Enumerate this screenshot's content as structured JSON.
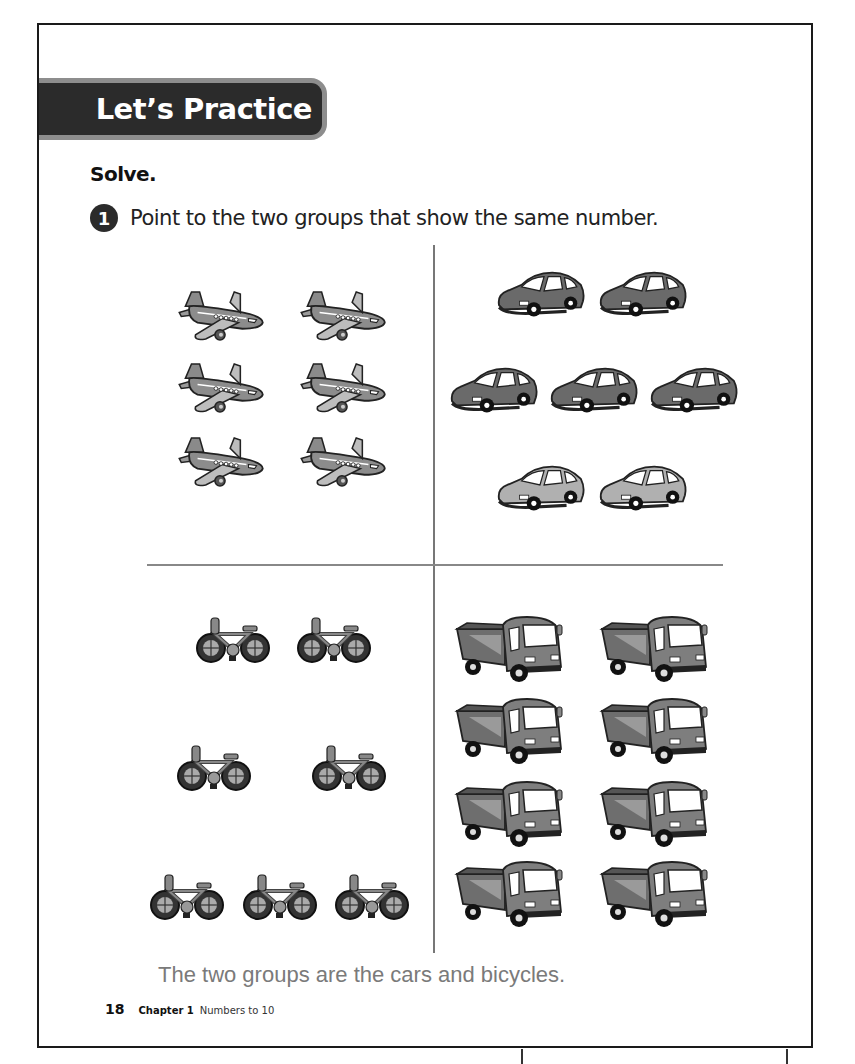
{
  "banner": {
    "title": "Let’s Practice"
  },
  "instruction": "Solve.",
  "question": {
    "number": "1",
    "text": "Point to the two groups that show the same number."
  },
  "groups": [
    {
      "name": "airplanes",
      "count": 6,
      "icon": "airplane-icon",
      "rows": [
        2,
        2,
        2
      ]
    },
    {
      "name": "cars",
      "count": 7,
      "icon": "car-icon",
      "rows": [
        2,
        3,
        2
      ]
    },
    {
      "name": "bicycles",
      "count": 7,
      "icon": "bicycle-icon",
      "rows": [
        2,
        2,
        3
      ]
    },
    {
      "name": "trucks",
      "count": 8,
      "icon": "truck-icon",
      "rows": [
        2,
        2,
        2,
        2
      ]
    }
  ],
  "answer": "The two groups are the cars and bicycles.",
  "footer": {
    "page_number": "18",
    "chapter": "Chapter 1",
    "chapter_title": "Numbers to 10"
  }
}
